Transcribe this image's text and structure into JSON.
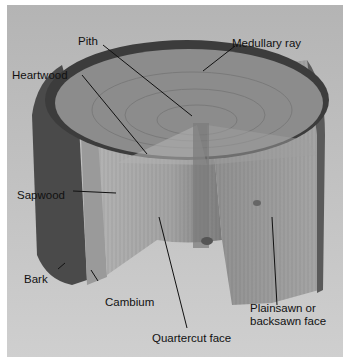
{
  "colors": {
    "background": "#b9b9b9",
    "bark": "#3a3a3a",
    "end_grain": "#8a8a8a",
    "quartercut_face": "#a8a8a8",
    "plainsawn_face": "#9c9c9c",
    "leader_line": "#111111"
  },
  "labels": [
    {
      "id": "pith",
      "text": "Pith"
    },
    {
      "id": "medullary-ray",
      "text": "Medullary ray"
    },
    {
      "id": "heartwood",
      "text": "Heartwood"
    },
    {
      "id": "sapwood",
      "text": "Sapwood"
    },
    {
      "id": "bark",
      "text": "Bark"
    },
    {
      "id": "cambium",
      "text": "Cambium"
    },
    {
      "id": "quartercut-face",
      "text": "Quartercut face"
    },
    {
      "id": "plainsawn-face-1",
      "text": "Plainsawn or"
    },
    {
      "id": "plainsawn-face-2",
      "text": "backsawn face"
    }
  ]
}
